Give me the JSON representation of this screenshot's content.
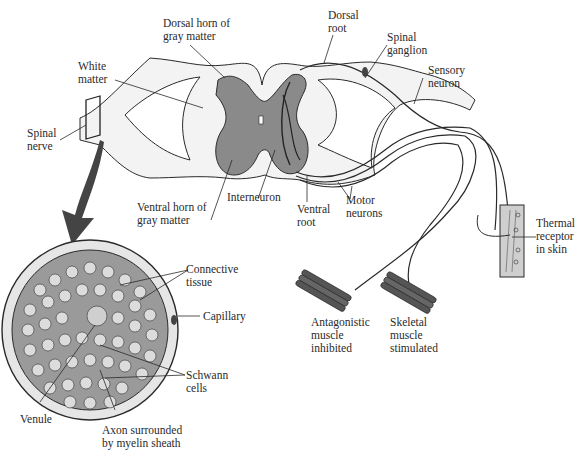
{
  "diagram": {
    "labels": {
      "dorsal_horn": "Dorsal horn of\ngray matter",
      "dorsal_root": "Dorsal\nroot",
      "spinal_ganglion": "Spinal\nganglion",
      "sensory_neuron": "Sensory\nneuron",
      "white_matter": "White\nmatter",
      "spinal_nerve": "Spinal\nnerve",
      "interneuron": "Interneuron",
      "ventral_horn": "Ventral horn of\ngray matter",
      "ventral_root": "Ventral\nroot",
      "motor_neurons": "Motor\nneurons",
      "thermal_receptor": "Thermal\nreceptor\nin skin",
      "antagonistic_muscle": "Antagonistic\nmuscle\ninhibited",
      "skeletal_muscle": "Skeletal\nmuscle\nstimulated",
      "connective_tissue": "Connective\ntissue",
      "capillary": "Capillary",
      "schwann_cells": "Schwann\ncells",
      "venule": "Venule",
      "axon": "Axon surrounded\nby myelin sheath"
    },
    "colors": {
      "gray_matter": "#8a8a8a",
      "white_matter": "#f2f2f2",
      "line": "#2a2a2a",
      "nerve_fill": "#bdbdbd"
    }
  }
}
